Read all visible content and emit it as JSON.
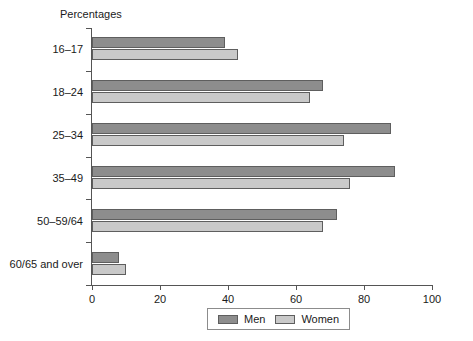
{
  "chart_data": {
    "type": "bar",
    "orientation": "horizontal",
    "title": "Percentages",
    "xlabel": "",
    "ylabel": "",
    "xlim": [
      0,
      100
    ],
    "xticks": [
      0,
      20,
      40,
      60,
      80,
      100
    ],
    "grid": false,
    "legend_position": "bottom",
    "categories": [
      "16–17",
      "18–24",
      "25–34",
      "35–49",
      "50–59/64",
      "60/65 and over"
    ],
    "series": [
      {
        "name": "Men",
        "color": "#8d8d8d",
        "values": [
          39,
          68,
          88,
          89,
          72,
          8
        ]
      },
      {
        "name": "Women",
        "color": "#c9c9c9",
        "values": [
          43,
          64,
          74,
          76,
          68,
          10
        ]
      }
    ]
  },
  "legend": {
    "items": [
      {
        "label": "Men"
      },
      {
        "label": "Women"
      }
    ]
  }
}
